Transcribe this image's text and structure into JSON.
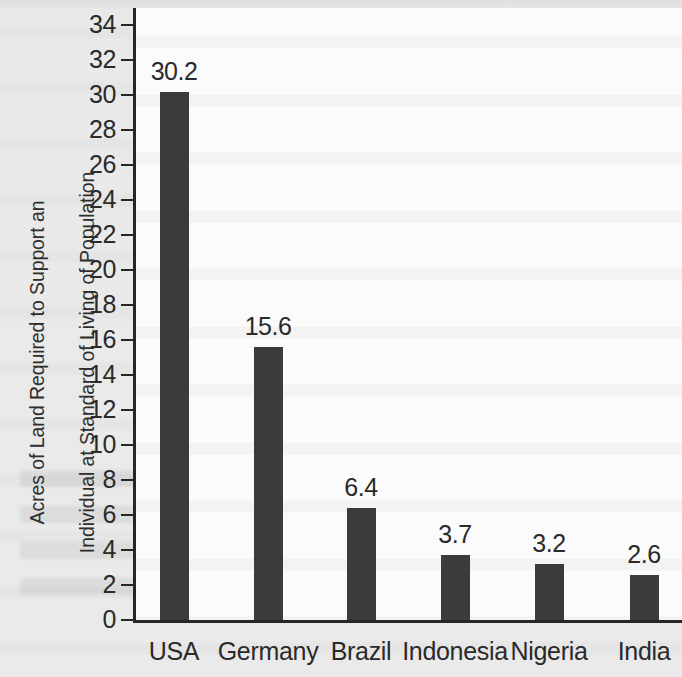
{
  "chart_data": {
    "type": "bar",
    "title": "",
    "xlabel": "",
    "ylabel": "Acres of Land Required to Support an Individual at Standard of Living of Population",
    "ylabel_lines": [
      "Acres of Land Required to Support an",
      "Individual at Standard of Living of Population"
    ],
    "categories": [
      "USA",
      "Germany",
      "Brazil",
      "Indonesia",
      "Nigeria",
      "India"
    ],
    "values": [
      30.2,
      15.6,
      6.4,
      3.7,
      3.2,
      2.6
    ],
    "value_labels": [
      "30.2",
      "15.6",
      "6.4",
      "3.7",
      "3.2",
      "2.6"
    ],
    "ylim": [
      0,
      35
    ],
    "ytick_step": 2,
    "ytick_labels": [
      "0",
      "2",
      "4",
      "6",
      "8",
      "10",
      "12",
      "14",
      "16",
      "18",
      "20",
      "22",
      "24",
      "26",
      "28",
      "30",
      "32",
      "34"
    ],
    "ytick_values": [
      0,
      2,
      4,
      6,
      8,
      10,
      12,
      14,
      16,
      18,
      20,
      22,
      24,
      26,
      28,
      30,
      32,
      34
    ],
    "grid": false,
    "legend": false,
    "legend_position": "none",
    "bar_color": "#3b3b3b",
    "axis_color": "#262626",
    "plot_background": "#fbfbfb",
    "page_background": "#e9e9e9",
    "text_color": "#2a2a2a"
  }
}
